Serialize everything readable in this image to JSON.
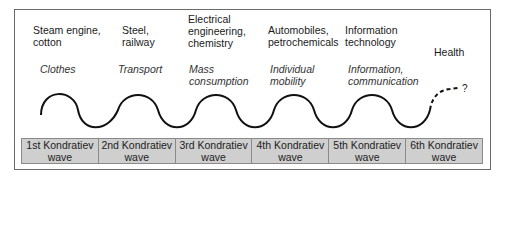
{
  "technologies": [
    "Steam engine,\ncotton",
    "Steel,\nrailway",
    "Electrical\nengineering,\nchemistry",
    "Automobiles,\npetrochemicals",
    "Information\ntechnology",
    "Health"
  ],
  "applications": [
    "Clothes",
    "Transport",
    "Mass\nconsumption",
    "Individual\nmobility",
    "Information,\ncommunication"
  ],
  "future_marker": "?",
  "waves": [
    {
      "name": "1st Kondratiev",
      "sub": "wave"
    },
    {
      "name": "2nd Kondratiev",
      "sub": "wave"
    },
    {
      "name": "3rd Kondratiev",
      "sub": "wave"
    },
    {
      "name": "4th Kondratiev",
      "sub": "wave"
    },
    {
      "name": "5th Kondratiev",
      "sub": "wave"
    },
    {
      "name": "6th Kondratiev",
      "sub": "wave"
    }
  ],
  "colors": {
    "bar": "#cfcfcf",
    "line": "#111111",
    "border": "#6a6a6a"
  }
}
